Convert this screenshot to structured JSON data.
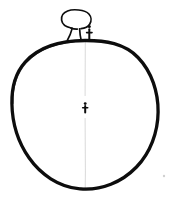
{
  "canvas": {
    "width": 173,
    "height": 198,
    "background_color": "#ffffff",
    "ink_color": "#0d0d0d",
    "faint_color": "#c9c9c9",
    "title": "Hand-drawn sketch of a globe with a tree and figures"
  },
  "drawing": {
    "style": "hand-drawn line sketch, black ink on white",
    "description": "A large circle representing the Earth, with a tree and a small standing figure on top of it, a small figure at the centre, and a faint vertical guide line through the middle.",
    "elements": [
      {
        "id": "globe",
        "label": "Large circle (globe)",
        "shape": "circle",
        "center_x": 85,
        "center_y": 114,
        "radius_x": 73,
        "radius_y": 74,
        "stroke_width": 3.2
      },
      {
        "id": "tree",
        "label": "Tree on top of globe",
        "shape": "canopy-and-trunk",
        "canopy_center_x": 76,
        "canopy_center_y": 19,
        "canopy_width": 30,
        "canopy_height": 20,
        "trunk_top_y": 27,
        "trunk_base_y": 41,
        "stroke_width": 1.6
      },
      {
        "id": "figure-on-top",
        "label": "Small standing figure on top of globe",
        "shape": "stick-figure",
        "x": 89,
        "head_y": 26,
        "base_y": 40,
        "stroke_width": 1.5
      },
      {
        "id": "figure-center",
        "label": "Small figure at centre of globe",
        "shape": "stick-figure",
        "x": 85,
        "head_y": 103,
        "base_y": 112,
        "stroke_width": 1.5
      },
      {
        "id": "center-guide-line",
        "label": "Faint vertical guide line",
        "shape": "line",
        "x": 85,
        "y_start": 40,
        "y_end": 190
      },
      {
        "id": "stray-dot",
        "label": "Faint stray dot near lower right",
        "shape": "dot",
        "x": 164,
        "y": 176,
        "radius": 1.2
      }
    ]
  }
}
